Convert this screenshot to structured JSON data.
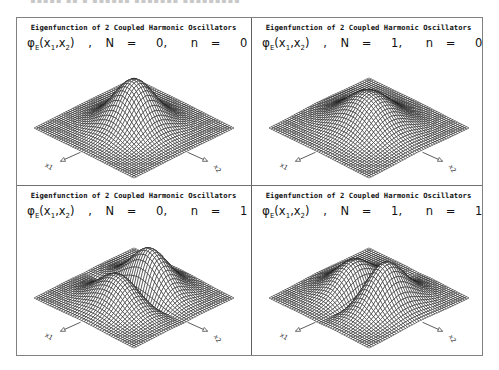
{
  "figure": {
    "panel_title": "Eigenfunction of 2 Coupled Harmonic Oscillators",
    "function_label": "φ",
    "function_subscript": "E",
    "args": "(x",
    "arg1_sub": "1",
    "arg_sep": ",x",
    "arg2_sub": "2",
    "args_close": ")",
    "comma": ",",
    "N_label": "N",
    "n_label": "n",
    "equals": "=",
    "axis_x1": "x1",
    "axis_x2": "x2",
    "mesh_color": "#1a1a1a",
    "border_color": "#808080"
  },
  "panels": [
    {
      "N": "0,",
      "n": "0",
      "shape": "single-peak"
    },
    {
      "N": "1,",
      "n": "0",
      "shape": "single-peak-wide"
    },
    {
      "N": "0,",
      "n": "1",
      "shape": "double-peak-antisymmetric-x1"
    },
    {
      "N": "1,",
      "n": "1",
      "shape": "double-peak-antisymmetric-x2"
    }
  ]
}
